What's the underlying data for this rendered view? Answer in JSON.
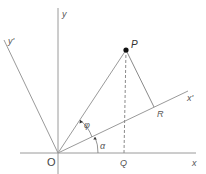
{
  "diagram": {
    "type": "coordinate-rotation",
    "labels": {
      "origin": "O",
      "x_axis": "x",
      "y_axis": "y",
      "x_prime_axis": "x'",
      "y_prime_axis": "y'",
      "point": "P",
      "foot_x": "Q",
      "foot_x_prime": "R",
      "angle_alpha": "α",
      "angle_phi": "φ"
    },
    "colors": {
      "line": "#8a8a8a",
      "point": "#111111",
      "text": "#555555"
    }
  }
}
